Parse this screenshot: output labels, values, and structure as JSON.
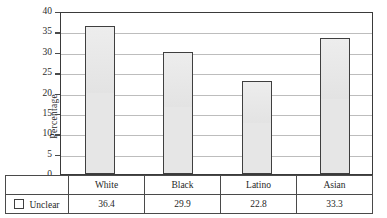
{
  "chart_data": {
    "type": "bar",
    "title": "",
    "xlabel": "",
    "ylabel": "Percentage",
    "categories": [
      "White",
      "Black",
      "Latino",
      "Asian"
    ],
    "values": [
      36.4,
      29.9,
      22.8,
      33.3
    ],
    "series": [
      {
        "name": "Unclear",
        "values": [
          36.4,
          29.9,
          22.8,
          33.3
        ]
      }
    ],
    "ylim": [
      0,
      40
    ],
    "ytick_labels": [
      "40",
      "35",
      "30",
      "25",
      "20",
      "15",
      "10",
      "5",
      "0"
    ],
    "ytick_values": [
      40,
      35,
      30,
      25,
      20,
      15,
      10,
      5,
      0
    ],
    "grid": true,
    "legend_position": "bottom-table",
    "bar_fill_color": "#e6e6e6",
    "bar_border_color": "#3f3f3f",
    "grid_color": "#bdbdbd",
    "axis_color": "#4a4a4a"
  },
  "table": {
    "legend_label": "Unclear",
    "legend_swatch_icon": "white-square-icon",
    "header_row": [
      "White",
      "Black",
      "Latino",
      "Asian"
    ],
    "value_row": [
      "36.4",
      "29.9",
      "22.8",
      "33.3"
    ]
  }
}
